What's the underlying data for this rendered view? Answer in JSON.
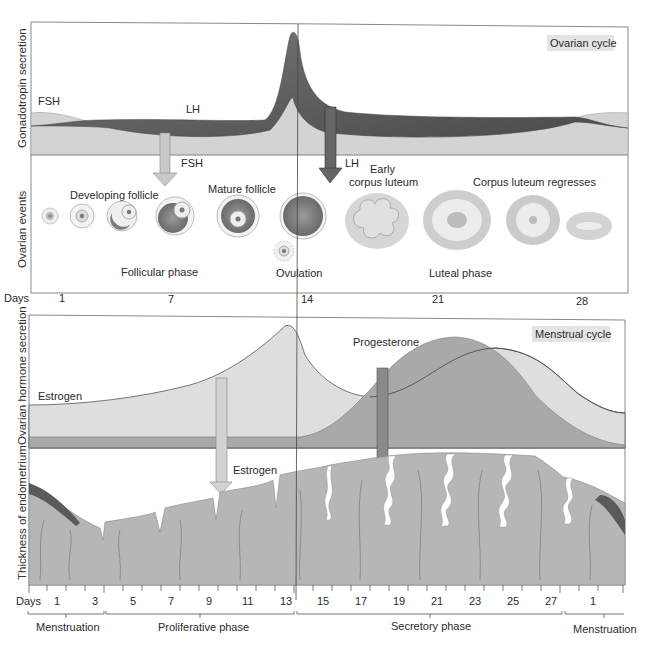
{
  "ovarian_panel": {
    "tag": "Ovarian cycle",
    "y_axis_top": "Gonadotropin secretion",
    "y_axis_bottom": "Ovarian events",
    "hormone_labels": {
      "fsh": "FSH",
      "lh": "LH"
    },
    "arrow_labels": {
      "fsh": "FSH",
      "lh": "LH"
    },
    "event_labels": {
      "developing_follicle": "Developing follicle",
      "mature_follicle": "Mature follicle",
      "early_corpus_luteum_1": "Early",
      "early_corpus_luteum_2": "corpus luteum",
      "corpus_luteum_regresses": "Corpus luteum regresses",
      "follicular_phase": "Follicular phase",
      "ovulation": "Ovulation",
      "luteal_phase": "Luteal phase"
    },
    "days_label": "Days",
    "days": [
      "1",
      "7",
      "14",
      "21",
      "28"
    ]
  },
  "menstrual_panel": {
    "tag": "Menstrual cycle",
    "y_axis_top": "Ovarian hormone secretion",
    "y_axis_bottom": "Thickness of endometrium",
    "hormone_labels": {
      "estrogen": "Estrogen",
      "progesterone": "Progesterone"
    },
    "arrow_labels": {
      "estrogen": "Estrogen",
      "progesterone": "Progesterone"
    },
    "days_label": "Days",
    "days": [
      "1",
      "3",
      "5",
      "7",
      "9",
      "11",
      "13",
      "15",
      "17",
      "19",
      "21",
      "23",
      "25",
      "27",
      "1"
    ],
    "phases": [
      "Menstruation",
      "Proliferative phase",
      "Secretory phase",
      "Menstruation"
    ]
  },
  "colors": {
    "fsh_fill": "#d2d2d2",
    "lh_fill": "#6e6e6e",
    "estrogen_fill": "#dcdcdc",
    "progesterone_fill": "#a8a8a8",
    "endometrium": "#b4b4b4",
    "arrow_light": "#c8c8c8",
    "arrow_dark": "#666666"
  }
}
